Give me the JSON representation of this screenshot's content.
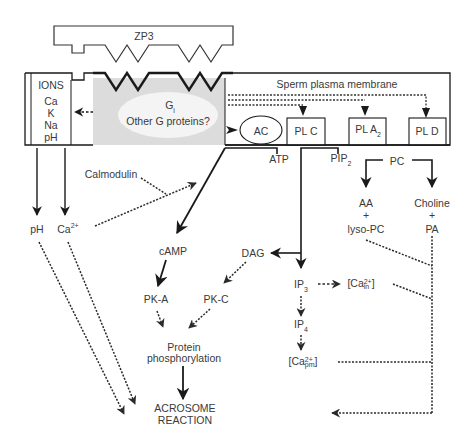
{
  "diagram": {
    "zp3": "ZP3",
    "membrane": {
      "title": "Sperm plasma membrane",
      "ions_header": "IONS",
      "ions": [
        "Ca",
        "K",
        "Na",
        "pH"
      ],
      "g_protein_line1": "G",
      "g_protein_line1_sub": "i",
      "g_protein_line2": "Other G proteins?",
      "enzymes": {
        "ac": "AC",
        "plc": "PL C",
        "pla2": "PL A",
        "pla2_sub": "2",
        "pld": "PL D"
      }
    },
    "nodes": {
      "atp": "ATP",
      "pip": "PIP",
      "pip_sub": "2",
      "pc": "PC",
      "ph": "pH",
      "ca": "Ca",
      "ca_sup": "2+",
      "calmodulin": "Calmodulin",
      "camp": "cAMP",
      "dag": "DAG",
      "pka": "PK-A",
      "pkc": "PK-C",
      "ip3": "IP",
      "ip3_sub": "3",
      "ip4": "IP",
      "ip4_sub": "4",
      "ca_in_open": "[Ca",
      "ca_in_sup": "2+",
      "ca_in_sub": "in",
      "ca_in_close": "]",
      "ca_pm_open": "[Ca",
      "ca_pm_sup": "2+",
      "ca_pm_sub": "pm",
      "ca_pm_close": "]",
      "aa": "AA",
      "plus1": "+",
      "lyso_pc": "lyso-PC",
      "choline": "Choline",
      "plus2": "+",
      "pa": "PA",
      "protein_line1": "Protein",
      "protein_line2": "phosphorylation",
      "acrosome_line1": "ACROSOME",
      "acrosome_line2": "REACTION"
    },
    "colors": {
      "line": "#1a1a1a",
      "text": "#3a3a3a",
      "gray_region": "#dcdcdc",
      "ellipse": "#f4f4f4"
    }
  }
}
